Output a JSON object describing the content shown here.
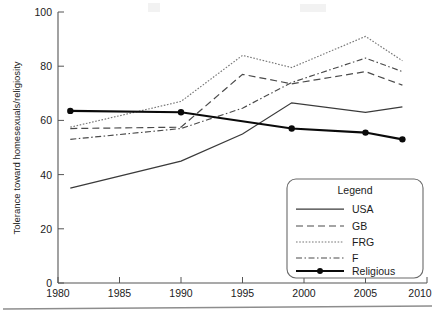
{
  "chart_data": {
    "type": "line",
    "title": "",
    "subtitle": "",
    "xlabel": "",
    "ylabel": "Tolerance toward homesexuals/religiosity",
    "xlim": [
      1980,
      2010
    ],
    "ylim": [
      0,
      100
    ],
    "grid": false,
    "legend_position": "inside-bottom-right",
    "legend_title": "Legend",
    "xticks": [
      "1980",
      "1985",
      "1990",
      "1995",
      "2000",
      "2005",
      "2010"
    ],
    "yticks": [
      "0",
      "20",
      "40",
      "60",
      "80",
      "100"
    ],
    "series": [
      {
        "name": "USA",
        "style": "solid",
        "color": "#3a3a3a",
        "x": [
          1981,
          1990,
          1995,
          1999,
          2005,
          2008
        ],
        "values": [
          35,
          45,
          55,
          66.5,
          63,
          65
        ]
      },
      {
        "name": "GB",
        "style": "dashed",
        "color": "#4a4a4a",
        "x": [
          1981,
          1990,
          1995,
          1999,
          2005,
          2008
        ],
        "values": [
          57,
          57.5,
          77,
          73.5,
          78,
          73
        ]
      },
      {
        "name": "FRG",
        "style": "dotted",
        "color": "#777777",
        "x": [
          1981,
          1990,
          1995,
          1999,
          2005,
          2008
        ],
        "values": [
          57.5,
          67,
          84,
          79.5,
          91,
          82
        ]
      },
      {
        "name": "F",
        "style": "dash-dot",
        "color": "#4a4a4a",
        "x": [
          1981,
          1990,
          1995,
          1999,
          2005,
          2008
        ],
        "values": [
          53,
          57,
          64.5,
          74,
          83,
          78
        ]
      },
      {
        "name": "Religious",
        "style": "solid-thick-markers",
        "color": "#0a0a0a",
        "marker": "circle",
        "x": [
          1981,
          1990,
          1999,
          2005,
          2008
        ],
        "values": [
          63.5,
          63,
          57,
          55.5,
          53
        ]
      }
    ]
  },
  "legend": {
    "title": "Legend",
    "entries": [
      {
        "label": "USA",
        "style": "solid"
      },
      {
        "label": "GB",
        "style": "dashed"
      },
      {
        "label": "FRG",
        "style": "dotted"
      },
      {
        "label": "F",
        "style": "dash-dot"
      },
      {
        "label": "Religious",
        "style": "solid-thick-markers"
      }
    ]
  },
  "axes": {
    "y_label": "Tolerance toward homesexuals/religiosity",
    "y_ticks": [
      "100",
      "80",
      "60",
      "40",
      "20",
      "0"
    ],
    "x_ticks": [
      "1980",
      "1985",
      "1990",
      "1995",
      "2000",
      "2005",
      "2010"
    ]
  }
}
